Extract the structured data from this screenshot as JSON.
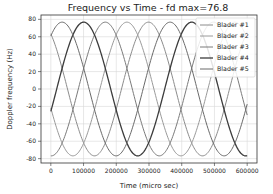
{
  "chart_data": {
    "type": "line",
    "title": "Frequency vs Time - fd max=76.8",
    "xlabel": "Time (micro sec)",
    "ylabel": "Doppler frequency (Hz)",
    "xlim": [
      -30000,
      630000
    ],
    "ylim": [
      -85,
      85
    ],
    "xticks": [
      0,
      100000,
      200000,
      300000,
      400000,
      500000,
      600000
    ],
    "xtick_labels": [
      "0",
      "100000",
      "200000",
      "300000",
      "400000",
      "500000",
      "600000"
    ],
    "yticks": [
      -80,
      -60,
      -40,
      -20,
      0,
      20,
      40,
      60,
      80
    ],
    "ytick_labels": [
      "-80",
      "-60",
      "-40",
      "-20",
      "0",
      "20",
      "40",
      "60",
      "80"
    ],
    "grid": true,
    "legend_position": "upper right",
    "amplitude": 76.8,
    "period": 330000,
    "x": [
      0,
      30000,
      60000,
      90000,
      120000,
      150000,
      180000,
      210000,
      240000,
      270000,
      300000,
      330000,
      360000,
      390000,
      420000,
      450000,
      480000,
      510000,
      540000,
      570000,
      600000
    ],
    "series": [
      {
        "name": "Blader #1",
        "color": "#8c8c8c",
        "phase_deg": 0
      },
      {
        "name": "Blader #2",
        "color": "#9a9a9a",
        "phase_deg": 72
      },
      {
        "name": "Blader #3",
        "color": "#7a7a7a",
        "phase_deg": 144
      },
      {
        "name": "Blader #4",
        "color": "#3c3c3c",
        "phase_deg": 216
      },
      {
        "name": "Blader #5",
        "color": "#6a6a6a",
        "phase_deg": 288
      }
    ]
  }
}
